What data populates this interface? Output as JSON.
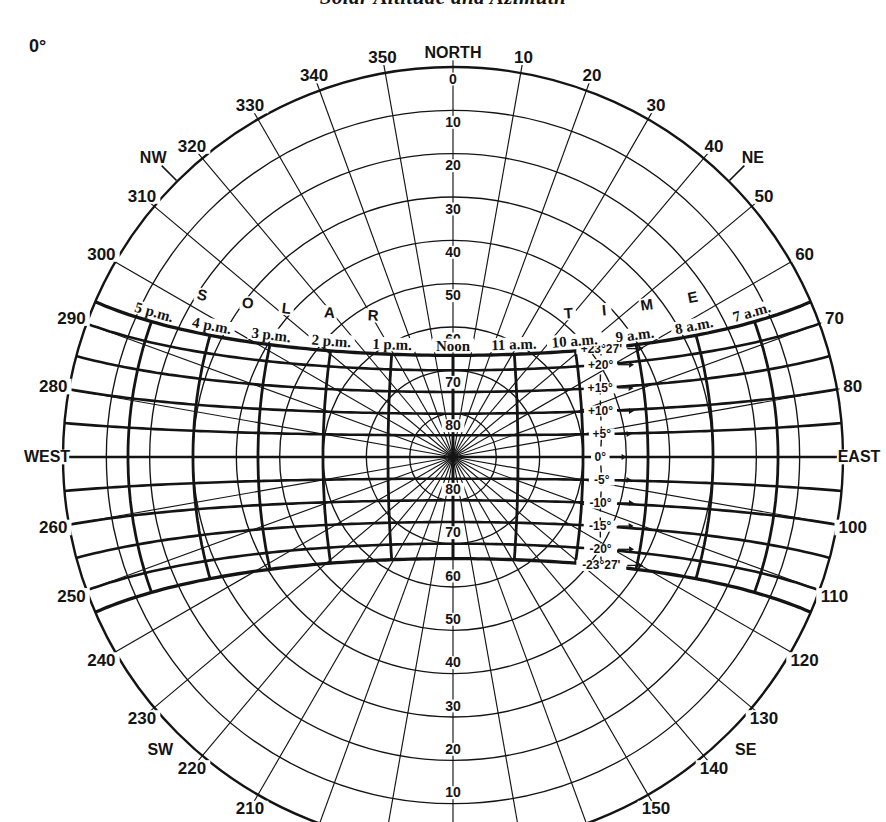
{
  "page": {
    "title": "Solar Altitude and Azimuth",
    "latitude_label": "0°"
  },
  "colors": {
    "ink": "#141414",
    "paper": "#ffffff"
  },
  "chart_data": {
    "type": "line",
    "chart_kind": "sun-path-polar-diagram",
    "title": "Solar Altitude and Azimuth",
    "latitude_deg": 0,
    "latitude_label": "0°",
    "projection": "polar-equidistant",
    "axes": {
      "azimuth_step_deg": 10,
      "altitude_circles_deg": [
        0,
        10,
        20,
        30,
        40,
        50,
        60,
        70,
        80
      ],
      "altitude_axis_labels_north": [
        "0",
        "10",
        "20",
        "30",
        "40",
        "50",
        "60",
        "70",
        "80"
      ],
      "altitude_axis_labels_south": [
        "80",
        "70",
        "60",
        "50",
        "40",
        "30",
        "20",
        "10"
      ],
      "azimuth_ring_labels": [
        {
          "deg": 0,
          "text": "NORTH"
        },
        {
          "deg": 10,
          "text": "10"
        },
        {
          "deg": 20,
          "text": "20"
        },
        {
          "deg": 30,
          "text": "30"
        },
        {
          "deg": 40,
          "text": "40"
        },
        {
          "deg": 45,
          "text": "NE"
        },
        {
          "deg": 50,
          "text": "50"
        },
        {
          "deg": 60,
          "text": "60"
        },
        {
          "deg": 70,
          "text": "70"
        },
        {
          "deg": 80,
          "text": "80"
        },
        {
          "deg": 90,
          "text": "EAST"
        },
        {
          "deg": 100,
          "text": "100"
        },
        {
          "deg": 110,
          "text": "110"
        },
        {
          "deg": 120,
          "text": "120"
        },
        {
          "deg": 130,
          "text": "130"
        },
        {
          "deg": 135,
          "text": "SE"
        },
        {
          "deg": 140,
          "text": "140"
        },
        {
          "deg": 150,
          "text": "150"
        },
        {
          "deg": 210,
          "text": "210"
        },
        {
          "deg": 220,
          "text": "220"
        },
        {
          "deg": 225,
          "text": "SW"
        },
        {
          "deg": 230,
          "text": "230"
        },
        {
          "deg": 240,
          "text": "240"
        },
        {
          "deg": 250,
          "text": "250"
        },
        {
          "deg": 260,
          "text": "260"
        },
        {
          "deg": 270,
          "text": "WEST"
        },
        {
          "deg": 280,
          "text": "280"
        },
        {
          "deg": 290,
          "text": "290"
        },
        {
          "deg": 300,
          "text": "300"
        },
        {
          "deg": 310,
          "text": "310"
        },
        {
          "deg": 315,
          "text": "NW"
        },
        {
          "deg": 320,
          "text": "320"
        },
        {
          "deg": 330,
          "text": "330"
        },
        {
          "deg": 340,
          "text": "340"
        },
        {
          "deg": 350,
          "text": "350"
        }
      ]
    },
    "series": {
      "declination_curves": [
        {
          "label": "+23°27'",
          "declination_deg": 23.45
        },
        {
          "label": "+20°",
          "declination_deg": 20
        },
        {
          "label": "+15°",
          "declination_deg": 15
        },
        {
          "label": "+10°",
          "declination_deg": 10
        },
        {
          "label": "+5°",
          "declination_deg": 5
        },
        {
          "label": "0°",
          "declination_deg": 0
        },
        {
          "label": "-5°",
          "declination_deg": -5
        },
        {
          "label": "-10°",
          "declination_deg": -10
        },
        {
          "label": "-15°",
          "declination_deg": -15
        },
        {
          "label": "-20°",
          "declination_deg": -20
        },
        {
          "label": "-23°27'",
          "declination_deg": -23.45
        }
      ],
      "hour_lines": [
        {
          "label": "5 p.m.",
          "hour_angle_deg": 75
        },
        {
          "label": "4 p.m.",
          "hour_angle_deg": 60
        },
        {
          "label": "3 p.m.",
          "hour_angle_deg": 45
        },
        {
          "label": "2 p.m.",
          "hour_angle_deg": 30
        },
        {
          "label": "1 p.m.",
          "hour_angle_deg": 15
        },
        {
          "label": "Noon",
          "hour_angle_deg": 0
        },
        {
          "label": "11 a.m.",
          "hour_angle_deg": -15
        },
        {
          "label": "10 a.m.",
          "hour_angle_deg": -30
        },
        {
          "label": "9 a.m.",
          "hour_angle_deg": -45
        },
        {
          "label": "8 a.m.",
          "hour_angle_deg": -60
        },
        {
          "label": "7 a.m.",
          "hour_angle_deg": -75
        }
      ]
    },
    "arc_text": {
      "west": "SOLAR",
      "east": "TIME"
    }
  }
}
